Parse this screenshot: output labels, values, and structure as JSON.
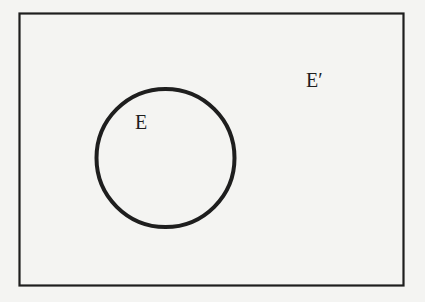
{
  "diagram": {
    "type": "venn",
    "universe": {
      "label": "E′"
    },
    "sets": [
      {
        "label": "E"
      }
    ],
    "colors": {
      "stroke": "#1e1e1e",
      "background": "#f4f4f2"
    }
  }
}
